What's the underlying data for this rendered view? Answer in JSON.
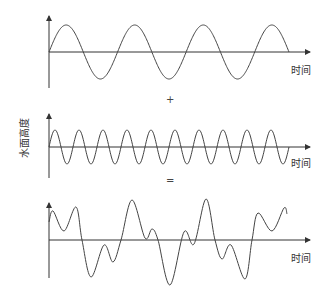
{
  "diagram": {
    "title": "",
    "y_axis_label": "水面高度",
    "panels": [
      {
        "name": "low-frequency-wave",
        "x_label": "时间",
        "cycles": 3.5
      },
      {
        "name": "high-frequency-wave",
        "x_label": "时间",
        "cycles": 10
      },
      {
        "name": "sum-wave",
        "x_label": "时间"
      }
    ],
    "operators": {
      "plus": "+",
      "equals": "="
    }
  }
}
